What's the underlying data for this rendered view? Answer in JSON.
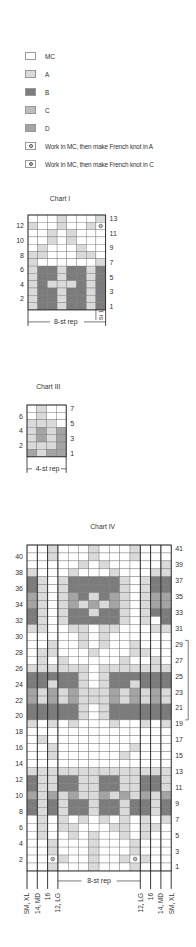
{
  "colors": {
    "MC": "#ffffff",
    "A": "#dadada",
    "B": "#7c7c7c",
    "C": "#bdbdbd",
    "D": "#a4a4a4",
    "grid": "#777777",
    "frame": "#222222"
  },
  "legend": [
    {
      "key": "MC",
      "label": "MC",
      "icon": "swatch-mc"
    },
    {
      "key": "A",
      "label": "A",
      "icon": "swatch-a"
    },
    {
      "key": "B",
      "label": "B",
      "icon": "swatch-b"
    },
    {
      "key": "C",
      "label": "C",
      "icon": "swatch-c"
    },
    {
      "key": "D",
      "label": "D",
      "icon": "swatch-d"
    },
    {
      "key": "KA",
      "label": "Work in MC, then make French knot in A",
      "icon": "french-knot-a-icon"
    },
    {
      "key": "KC",
      "label": "Work in MC, then make French knot in C",
      "icon": "french-knot-c-icon"
    }
  ],
  "chart_data": [
    {
      "type": "table",
      "title": "Chart I",
      "cols": 8,
      "row_labels_left": [
        "12",
        "10",
        "8",
        "6",
        "4",
        "2"
      ],
      "row_labels_right": [
        "13",
        "11",
        "9",
        "7",
        "5",
        "3",
        "1"
      ],
      "footer": "8-st rep",
      "side_label": "St 1",
      "rows_top_to_bottom": [
        "MMMAMMMA",
        "AMMAMMAK",
        "MMAMAMMM",
        "MMAMAMMM",
        "MAMMMAMM",
        "AAMMMAAM",
        "AMMMMMMA",
        "ABBABBAB",
        "ABBABBAB",
        "ABAAABAB",
        "ABBABBAB",
        "ABBABBAB",
        "ABBABBAB"
      ]
    },
    {
      "type": "table",
      "title": "Chart III",
      "cols": 4,
      "row_labels_left": [
        "6",
        "4",
        "2"
      ],
      "row_labels_right": [
        "7",
        "5",
        "3",
        "1"
      ],
      "footer": "4-st rep",
      "rows_top_to_bottom": [
        "MAMM",
        "MAMM",
        "AAAM",
        "ADAD",
        "ADAD",
        "AAAD",
        "DADD"
      ]
    },
    {
      "type": "table",
      "title": "Chart IV",
      "cols": 14,
      "row_labels_left": [
        "40",
        "38",
        "36",
        "34",
        "32",
        "30",
        "28",
        "26",
        "24",
        "22",
        "20",
        "18",
        "16",
        "14",
        "12",
        "10",
        "8",
        "6",
        "4",
        "2"
      ],
      "row_labels_right": [
        "41",
        "39",
        "37",
        "35",
        "33",
        "31",
        "29",
        "27",
        "25",
        "23",
        "21",
        "19",
        "17",
        "15",
        "13",
        "11",
        "9",
        "7",
        "5",
        "3",
        "1"
      ],
      "footer": "8-st rep",
      "size_labels_left": [
        "SM, XL",
        "14, MD",
        "16",
        "12, LG"
      ],
      "size_labels_right": [
        "12, LG",
        "16",
        "14, MD",
        "SM, XL"
      ],
      "rows_top_to_bottom": [
        "MMAMMMAMMMAMMM",
        "MMAMMMAMMMAMMM",
        "MMMMMAMAMMMMMA",
        "AMMMAMMMAMMMAA",
        "BAMABBBBBAMABB",
        "BAMABBBBBAMABB",
        "DAMADBABDAMADD",
        "DAMADADADAMADD",
        "BAMABBABBAMABB",
        "BAMABBBBBAMAMB",
        "AAMMAAMAAMMMAA",
        "MMMMMAMAMMMMMM",
        "MMAMMAMAMMAMMM",
        "MAAMMMAMMMAAMM",
        "MAMAMMMMMAMMAM",
        "AAAAAAMAAAAAAA",
        "BBBBBAMABBBBBB",
        "BBABBAMABBABBB",
        "DADADAAADADADA",
        "DADADAAADADADA",
        "BBBBBAMABBBBBB",
        "BBBBBAMABBBBBB",
        "AMAMAMMMAMMAMA",
        "MMMMMMMMMMMMMM",
        "MAMMMMMMMMMMMM",
        "MMAMMMMMMMAMMM",
        "MMAMMMMMMAMMMM",
        "MMMMMMMMMMMMMM",
        "AAAAAAAAAAAAAA",
        "BAABBAABBAABBA",
        "BAABBAABBAABBA",
        "DADADAADADADAD",
        "BABABBABBABBAB",
        "BABABBABBABBAB",
        "MAMAMAMAMAMAMA",
        "MAMAAMMMAAMAAM",
        "MAMMAMAMMAMAMM",
        "MMAMMMAMMMAMMM",
        "MMAMMMAMMMAMMM",
        "MMKAMMAMMAKAMM",
        "MMAMMMAMMMAMMM"
      ]
    }
  ]
}
